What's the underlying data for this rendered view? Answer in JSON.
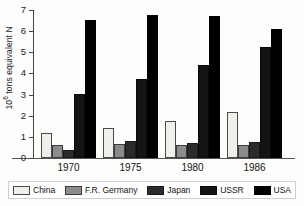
{
  "chart_data": {
    "type": "bar",
    "title": "",
    "subtitle": "",
    "xlabel": "",
    "ylabel": "10⁶ tons equivalent N",
    "ylabel_base": "10",
    "ylabel_exp": "6",
    "ylabel_rest": " tons equivalent N",
    "ylim": [
      0,
      7
    ],
    "ytick_labels": [
      "0",
      "1",
      "2",
      "3",
      "4",
      "5",
      "6",
      "7"
    ],
    "ytick_values": [
      0,
      1,
      2,
      3,
      4,
      5,
      6,
      7
    ],
    "grid": false,
    "legend_position": "bottom",
    "categories": [
      "1970",
      "1975",
      "1980",
      "1986"
    ],
    "series": [
      {
        "name": "China",
        "key": "china",
        "color": "#f0efe9",
        "values": [
          1.2,
          1.4,
          1.75,
          2.2
        ]
      },
      {
        "name": "F.R. Germany",
        "key": "germany",
        "color": "#8b8b8b",
        "values": [
          0.6,
          0.65,
          0.6,
          0.6
        ]
      },
      {
        "name": "Japan",
        "key": "japan",
        "color": "#2b2b2b",
        "values": [
          0.4,
          0.8,
          0.7,
          0.75
        ]
      },
      {
        "name": "USSR",
        "key": "ussr",
        "color": "#141414",
        "values": [
          3.05,
          3.75,
          4.4,
          5.25
        ]
      },
      {
        "name": "USA",
        "key": "usa",
        "color": "#000000",
        "values": [
          6.55,
          6.75,
          6.7,
          6.1
        ]
      }
    ]
  },
  "legend": {
    "items": [
      {
        "label": "China"
      },
      {
        "label": "F.R. Germany"
      },
      {
        "label": "Japan"
      },
      {
        "label": "USSR"
      },
      {
        "label": "USA"
      }
    ]
  },
  "axis": {
    "y_ticks": [
      {
        "label": "7"
      },
      {
        "label": "6"
      },
      {
        "label": "5"
      },
      {
        "label": "4"
      },
      {
        "label": "3"
      },
      {
        "label": "2"
      },
      {
        "label": "1"
      },
      {
        "label": "0"
      }
    ],
    "x_groups": [
      {
        "label": "1970"
      },
      {
        "label": "1975"
      },
      {
        "label": "1980"
      },
      {
        "label": "1986"
      }
    ]
  }
}
